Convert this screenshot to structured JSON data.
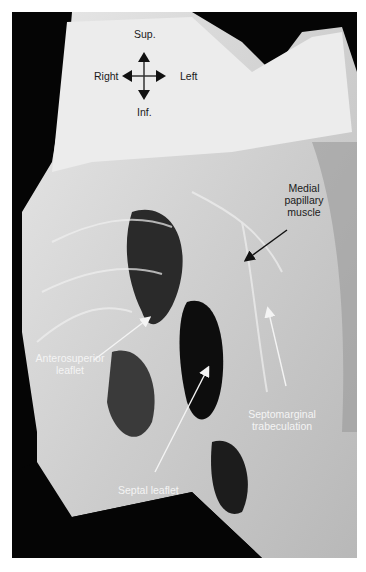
{
  "figure": {
    "orientation": {
      "superior": "Sup.",
      "inferior": "Inf.",
      "right": "Right",
      "left": "Left"
    },
    "labels": {
      "medial_papillary_muscle": [
        "Medial",
        "papillary",
        "muscle"
      ],
      "anterosuperior_leaflet": [
        "Anterosuperior",
        "leaflet"
      ],
      "septomarginal_trabeculation": [
        "Septomarginal",
        "trabeculation"
      ],
      "septal_leaflet": "Septal leaflet"
    },
    "colors": {
      "background": "#050505",
      "tissue": "#d9d9d9",
      "tissue_light": "#ececec",
      "label_dark": "#1a1a1a",
      "label_light": "#f4f4f4"
    }
  }
}
